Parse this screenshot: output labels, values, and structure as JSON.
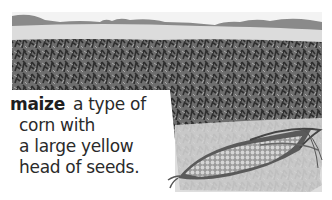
{
  "entry": {
    "headword": "maize",
    "definition_lines": [
      "a type of",
      "corn with",
      "a large yellow",
      "head of seeds."
    ]
  },
  "illustration": {
    "subject": "maize-field-and-corn-cob",
    "palette": {
      "sky": "#f6f6f6",
      "distant_field": "#d9d9d9",
      "hedgerow": "#7a7a7a",
      "crop_dark": "#3d3d3d",
      "crop_mid": "#6b6b6b",
      "cob_light": "#c8c8c8",
      "husk": "#555555"
    }
  }
}
